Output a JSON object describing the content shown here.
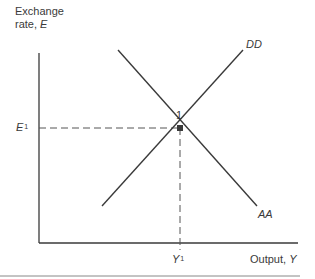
{
  "diagram": {
    "y_axis_label_line1": "Exchange",
    "y_axis_label_line2": "rate, ",
    "y_axis_var": "E",
    "x_axis_label": "Output, ",
    "x_axis_var": "Y",
    "curves": [
      {
        "name": "DD",
        "label": "DD",
        "slope": "upward"
      },
      {
        "name": "AA",
        "label": "AA",
        "slope": "downward"
      }
    ],
    "equilibrium": {
      "point_label": "1",
      "e_label": "E",
      "e_sup": "1",
      "y_label": "Y",
      "y_sup": "1"
    },
    "colors": {
      "line": "#3a3a3a",
      "dash": "#555555"
    }
  }
}
